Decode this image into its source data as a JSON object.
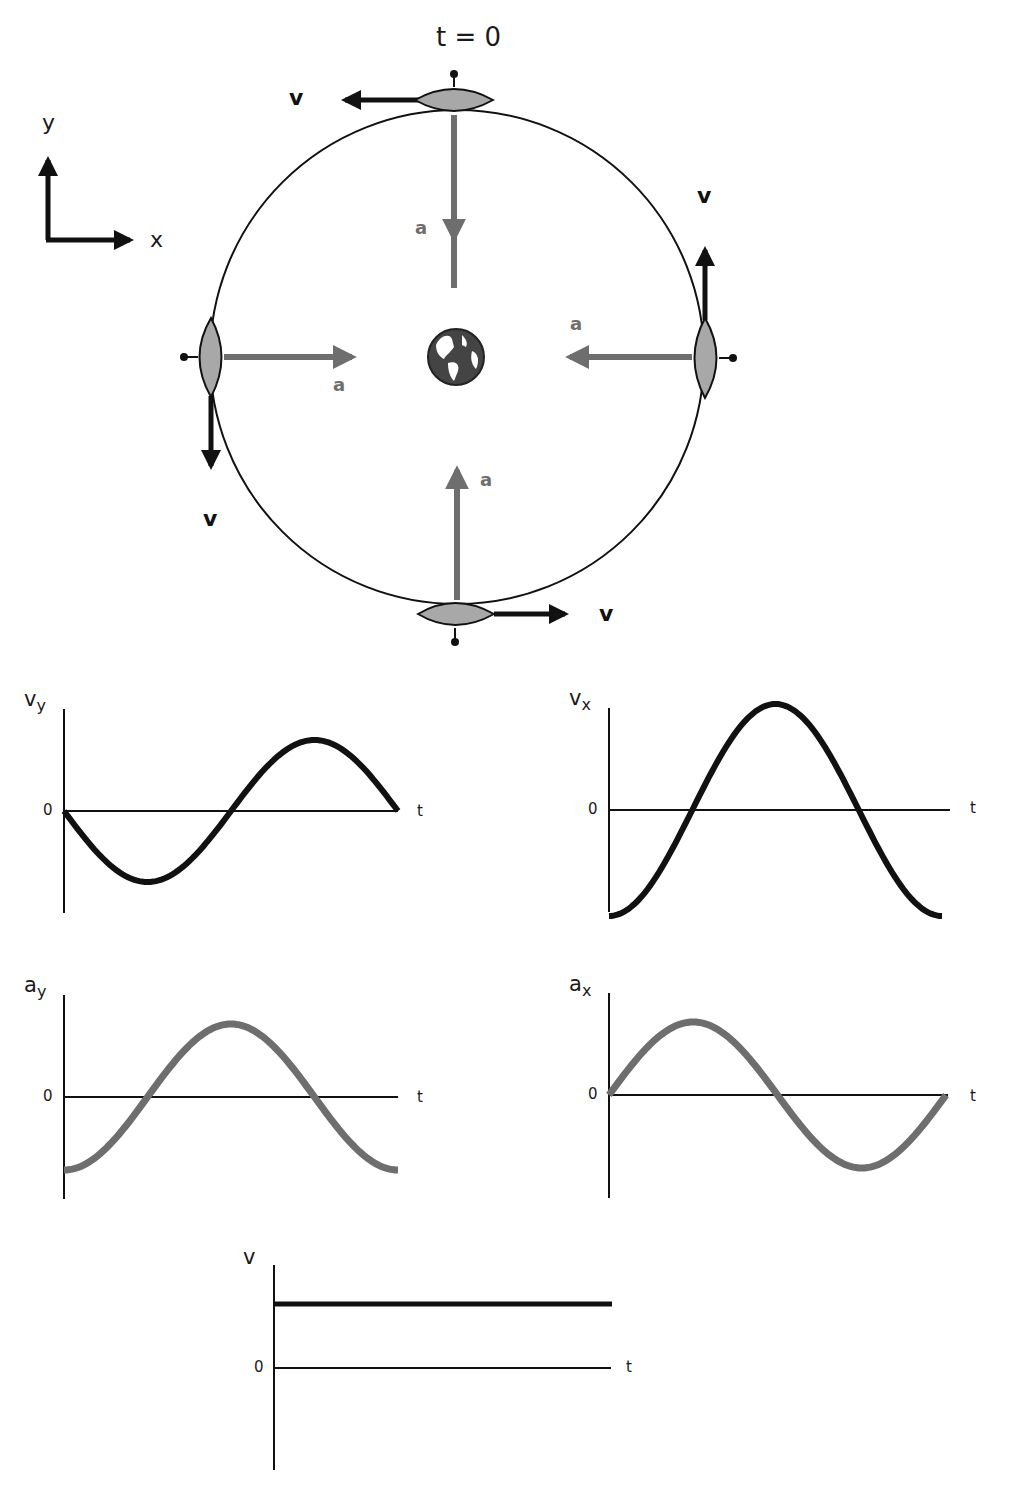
{
  "diagram": {
    "title": "t = 0",
    "axes": {
      "x_label": "x",
      "y_label": "y"
    },
    "orbit": {
      "cx": 457,
      "cy": 357,
      "r": 247
    },
    "colors": {
      "velocity": "#111111",
      "acceleration": "#6e6e6e",
      "satellite_fill": "#a8a8a8",
      "orbit": "#111111"
    },
    "central_body": {
      "name": "Earth",
      "icon": "globe-icon"
    },
    "satellites": [
      {
        "position": "top",
        "velocity_label": "v",
        "velocity_dir": "left",
        "accel_label": "a",
        "accel_dir": "down"
      },
      {
        "position": "right",
        "velocity_label": "v",
        "velocity_dir": "up",
        "accel_label": "a",
        "accel_dir": "left"
      },
      {
        "position": "bottom",
        "velocity_label": "v",
        "velocity_dir": "right",
        "accel_label": "a",
        "accel_dir": "up"
      },
      {
        "position": "left",
        "velocity_label": "v",
        "velocity_dir": "down",
        "accel_label": "a",
        "accel_dir": "right"
      }
    ]
  },
  "labels": {
    "v_top": "v",
    "v_right": "v",
    "v_bottom": "v",
    "v_left": "v",
    "a_top": "a",
    "a_right": "a",
    "a_bottom": "a",
    "a_left": "a"
  },
  "graphs": {
    "vy": {
      "label_main": "v",
      "label_sub": "y",
      "zero": "0",
      "t": "t"
    },
    "vx": {
      "label_main": "v",
      "label_sub": "x",
      "zero": "0",
      "t": "t"
    },
    "ay": {
      "label_main": "a",
      "label_sub": "y",
      "zero": "0",
      "t": "t"
    },
    "ax": {
      "label_main": "a",
      "label_sub": "x",
      "zero": "0",
      "t": "t"
    },
    "v": {
      "label_main": "v",
      "label_sub": "",
      "zero": "0",
      "t": "t"
    }
  },
  "chart_data": [
    {
      "type": "line",
      "title": "v_y vs t",
      "ylabel": "v_y",
      "xlabel": "t",
      "x": [
        0,
        0.25,
        0.5,
        0.75,
        1.0
      ],
      "values": [
        0,
        -1,
        0,
        1,
        0
      ],
      "shape": "-sin(2πt/T)",
      "color": "#111111"
    },
    {
      "type": "line",
      "title": "v_x vs t",
      "ylabel": "v_x",
      "xlabel": "t",
      "x": [
        0,
        0.25,
        0.5,
        0.75,
        1.0
      ],
      "values": [
        -1,
        0,
        1,
        0,
        -1
      ],
      "shape": "-cos(2πt/T)",
      "color": "#111111"
    },
    {
      "type": "line",
      "title": "a_y vs t",
      "ylabel": "a_y",
      "xlabel": "t",
      "x": [
        0,
        0.25,
        0.5,
        0.75,
        1.0
      ],
      "values": [
        -1,
        0,
        1,
        0,
        -1
      ],
      "shape": "-cos(2πt/T)",
      "color": "#6e6e6e"
    },
    {
      "type": "line",
      "title": "a_x vs t",
      "ylabel": "a_x",
      "xlabel": "t",
      "x": [
        0,
        0.25,
        0.5,
        0.75,
        1.0
      ],
      "values": [
        0,
        1,
        0,
        -1,
        0
      ],
      "shape": "sin(2πt/T)",
      "color": "#6e6e6e"
    },
    {
      "type": "line",
      "title": "v vs t",
      "ylabel": "v",
      "xlabel": "t",
      "x": [
        0,
        1.0
      ],
      "values": [
        1,
        1
      ],
      "shape": "constant",
      "color": "#111111"
    }
  ]
}
